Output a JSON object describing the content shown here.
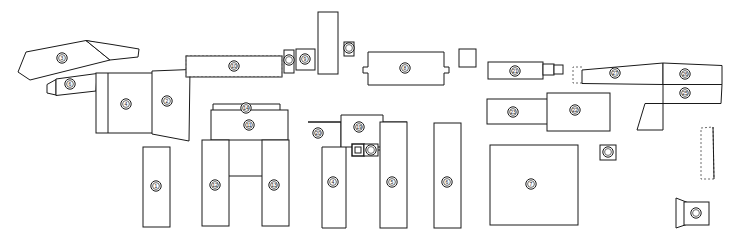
{
  "drawing": {
    "title": "Exploded parts layout plan",
    "type": "technical-line-drawing",
    "background_color": "#ffffff",
    "line_color": "#1a1a1a",
    "dashed_line_color": "#6b6b6b",
    "width": 731,
    "height": 238
  },
  "parts": [
    {
      "id": "p01",
      "name": "curved-strip-top-left",
      "shape": "polygon",
      "points": "18,72 26,52 86,40 112,46 110,60 30,80",
      "marker": {
        "cx": 62,
        "cy": 58,
        "label": "3"
      }
    },
    {
      "id": "p02",
      "name": "tapered-wing-top-left",
      "shape": "polygon",
      "points": "86,40 112,46 110,60 136,56 138,50 110,44",
      "marker": null
    },
    {
      "id": "p03",
      "name": "small-bar-left",
      "shape": "polygon",
      "points": "48,84 54,79 96,74 94,92 52,96 48,92",
      "marker": {
        "cx": 70,
        "cy": 84,
        "label": "6"
      }
    },
    {
      "id": "p04",
      "name": "tab-left-small",
      "shape": "rect",
      "x": 46,
      "y": 86,
      "w": 10,
      "h": 8,
      "marker": null
    },
    {
      "id": "p05",
      "name": "panel-wide-left",
      "shape": "rect",
      "x": 96,
      "y": 73,
      "w": 62,
      "h": 60,
      "marker": {
        "cx": 126,
        "cy": 104,
        "label": "4"
      }
    },
    {
      "id": "p06",
      "name": "panel-left-sliver",
      "shape": "rect",
      "x": 96,
      "y": 73,
      "w": 12,
      "h": 60,
      "marker": null
    },
    {
      "id": "p07",
      "name": "panel-mid-left",
      "shape": "polygon",
      "points": "152,70 190,69 188,140 152,134",
      "marker": {
        "cx": 167,
        "cy": 101,
        "label": "2"
      }
    },
    {
      "id": "p08",
      "name": "long-horizontal-beam",
      "shape": "polygon",
      "points": "186,56 282,55 282,76 186,77",
      "marker": {
        "cx": 234,
        "cy": 66,
        "label": "10"
      }
    },
    {
      "id": "p09",
      "name": "beam-dashed-outline",
      "shape": "dashed-rect",
      "x": 186,
      "y": 55,
      "w": 96,
      "h": 22,
      "marker": null
    },
    {
      "id": "p10",
      "name": "connector-block-small",
      "shape": "rect",
      "x": 284,
      "y": 50,
      "w": 10,
      "h": 22,
      "marker": {
        "cx": 289,
        "cy": 60,
        "label": ""
      }
    },
    {
      "id": "p11",
      "name": "connector-block-square",
      "shape": "rect",
      "x": 296,
      "y": 49,
      "w": 18,
      "h": 20,
      "marker": {
        "cx": 305,
        "cy": 59,
        "label": "9"
      }
    },
    {
      "id": "p12",
      "name": "tall-vertical-plate",
      "shape": "rect",
      "x": 318,
      "y": 12,
      "w": 20,
      "h": 62,
      "marker": null
    },
    {
      "id": "p13",
      "name": "small-tab-upper",
      "shape": "rect",
      "x": 344,
      "y": 42,
      "w": 10,
      "h": 14,
      "marker": {
        "cx": 349,
        "cy": 48,
        "label": ""
      }
    },
    {
      "id": "p14",
      "name": "notched-box-center",
      "shape": "polygon",
      "points": "368,52 444,52 444,68 448,68 448,74 444,74 444,85 368,85 368,74 364,74 364,68 368,68",
      "marker": {
        "cx": 405,
        "cy": 68,
        "label": "8"
      }
    },
    {
      "id": "p15",
      "name": "small-square-center-right",
      "shape": "rect",
      "x": 459,
      "y": 49,
      "w": 17,
      "h": 18,
      "marker": null
    },
    {
      "id": "p16",
      "name": "bar-with-tab-upper-right",
      "shape": "polygon",
      "points": "488,62 543,62 543,78 488,78",
      "marker": {
        "cx": 515,
        "cy": 71,
        "label": "21"
      }
    },
    {
      "id": "p17",
      "name": "tab-upper-right",
      "shape": "rect",
      "x": 543,
      "y": 64,
      "w": 18,
      "h": 10,
      "marker": null
    },
    {
      "id": "p18",
      "name": "tab-upper-right-end",
      "shape": "rect",
      "x": 553,
      "y": 65,
      "w": 9,
      "h": 8,
      "marker": null
    },
    {
      "id": "p19",
      "name": "dashed-notch-right",
      "shape": "dashed-poly",
      "points": "573,66 582,66 582,82 573,82",
      "marker": null
    },
    {
      "id": "p20",
      "name": "slanted-band-right-a",
      "shape": "polygon",
      "points": "582,69 663,63 663,84 582,83",
      "marker": {
        "cx": 615,
        "cy": 73,
        "label": "27"
      }
    },
    {
      "id": "p21",
      "name": "slanted-band-right-b",
      "shape": "polygon",
      "points": "663,63 722,65 722,84 663,84",
      "marker": {
        "cx": 685,
        "cy": 74,
        "label": "26"
      }
    },
    {
      "id": "p22",
      "name": "slanted-band-right-c",
      "shape": "polygon",
      "points": "663,84 722,84 722,104 663,104",
      "marker": {
        "cx": 685,
        "cy": 93,
        "label": "25"
      }
    },
    {
      "id": "p23",
      "name": "angled-foot-right",
      "shape": "polygon",
      "points": "637,130 645,104 663,104 663,130",
      "marker": null
    },
    {
      "id": "p24",
      "name": "bar-mid-right-left",
      "shape": "rect",
      "x": 487,
      "y": 99,
      "w": 60,
      "h": 25,
      "marker": {
        "cx": 513,
        "cy": 112,
        "label": "23"
      }
    },
    {
      "id": "p25",
      "name": "bar-mid-right-right",
      "shape": "rect",
      "x": 547,
      "y": 93,
      "w": 63,
      "h": 38,
      "marker": {
        "cx": 575,
        "cy": 110,
        "label": "22"
      }
    },
    {
      "id": "p26",
      "name": "tall-panel-center",
      "shape": "rect",
      "x": 434,
      "y": 123,
      "w": 27,
      "h": 105,
      "marker": {
        "cx": 447,
        "cy": 182,
        "label": "6"
      }
    },
    {
      "id": "p27",
      "name": "large-square-lower-right",
      "shape": "rect",
      "x": 490,
      "y": 145,
      "w": 88,
      "h": 80,
      "marker": {
        "cx": 531,
        "cy": 184,
        "label": "7"
      }
    },
    {
      "id": "p28",
      "name": "small-marker-box-right",
      "shape": "marker-box",
      "x": 600,
      "y": 145,
      "w": 16,
      "h": 15,
      "marker": {
        "cx": 608,
        "cy": 152,
        "label": ""
      }
    },
    {
      "id": "p29",
      "name": "dashed-tall-strip-right",
      "shape": "dashed-rect",
      "x": 700,
      "y": 127,
      "w": 14,
      "h": 52,
      "marker": null
    },
    {
      "id": "p30",
      "name": "arrow-flag-bottom-right",
      "shape": "polygon",
      "points": "676,198 694,205 694,222 676,228",
      "marker": null
    },
    {
      "id": "p31",
      "name": "arrow-flag-box",
      "shape": "rect",
      "x": 684,
      "y": 202,
      "w": 24,
      "h": 22,
      "marker": {
        "cx": 696,
        "cy": 213,
        "label": ""
      }
    },
    {
      "id": "p32",
      "name": "cap-bracket-upper",
      "shape": "polygon",
      "points": "213,104 280,104 280,112 213,112",
      "marker": {
        "cx": 246,
        "cy": 108,
        "label": "14"
      }
    },
    {
      "id": "p33",
      "name": "wide-plate-u-top",
      "shape": "rect",
      "x": 211,
      "y": 110,
      "w": 77,
      "h": 30,
      "marker": {
        "cx": 249,
        "cy": 125,
        "label": "11"
      }
    },
    {
      "id": "p34",
      "name": "u-leg-left",
      "shape": "rect",
      "x": 202,
      "y": 140,
      "w": 27,
      "h": 86,
      "marker": {
        "cx": 215,
        "cy": 185,
        "label": "12"
      }
    },
    {
      "id": "p35",
      "name": "u-cross-bar",
      "shape": "rect",
      "x": 229,
      "y": 175,
      "w": 33,
      "h": 2,
      "marker": null
    },
    {
      "id": "p36",
      "name": "u-leg-right",
      "shape": "rect",
      "x": 262,
      "y": 140,
      "w": 27,
      "h": 86,
      "marker": {
        "cx": 274,
        "cy": 185,
        "label": "13"
      }
    },
    {
      "id": "p37",
      "name": "strip-lone-left",
      "shape": "rect",
      "x": 143,
      "y": 147,
      "w": 27,
      "h": 80,
      "marker": {
        "cx": 156,
        "cy": 186,
        "label": "1"
      }
    },
    {
      "id": "p38",
      "name": "l-shape-lower-mid",
      "shape": "polygon",
      "points": "308,122 340,122 340,147 322,147 322,227 346,227 346,152 346,122",
      "marker": null
    },
    {
      "id": "p39",
      "name": "l-shape-body",
      "shape": "polygon",
      "points": "308,122 340,122 340,147 322,147 322,228 346,228 346,122",
      "marker": {
        "cx": 333,
        "cy": 182,
        "label": "4"
      }
    },
    {
      "id": "p40",
      "name": "l-shape-corner-marker",
      "shape": "none",
      "marker": {
        "cx": 318,
        "cy": 133,
        "label": "20"
      }
    },
    {
      "id": "p41",
      "name": "block-center-mid",
      "shape": "rect",
      "x": 340,
      "y": 115,
      "w": 42,
      "h": 32,
      "marker": {
        "cx": 359,
        "cy": 127,
        "label": "19"
      }
    },
    {
      "id": "p42",
      "name": "square-connector-dark",
      "shape": "square-dark",
      "x": 352,
      "y": 144,
      "w": 12,
      "h": 12,
      "marker": null
    },
    {
      "id": "p43",
      "name": "marker-box-adjacent",
      "shape": "marker-box",
      "x": 364,
      "y": 144,
      "w": 14,
      "h": 12,
      "marker": {
        "cx": 371,
        "cy": 150,
        "label": ""
      }
    },
    {
      "id": "p44",
      "name": "panel-right-of-l",
      "shape": "rect",
      "x": 380,
      "y": 122,
      "w": 27,
      "h": 106,
      "marker": {
        "cx": 392,
        "cy": 182,
        "label": "5"
      }
    }
  ],
  "markers": {
    "style": "circular-callout",
    "count": 24,
    "labels": [
      "1",
      "2",
      "3",
      "4",
      "5",
      "6",
      "7",
      "8",
      "9",
      "10",
      "11",
      "12",
      "13",
      "14",
      "19",
      "20",
      "21",
      "22",
      "23",
      "25",
      "26",
      "27"
    ]
  }
}
